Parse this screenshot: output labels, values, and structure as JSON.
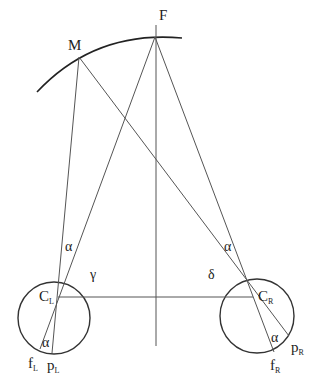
{
  "diagram": {
    "colors": {
      "stroke": "#333333",
      "arc": "#222222",
      "text": "#222222",
      "background": "#ffffff"
    },
    "points": {
      "F": {
        "label": "F",
        "x": 155,
        "y": 37
      },
      "M": {
        "label": "M",
        "x": 79,
        "y": 57
      },
      "CL": {
        "label": "C",
        "sub": "L",
        "x": 58,
        "y": 298
      },
      "CR": {
        "label": "C",
        "sub": "R",
        "x": 253,
        "y": 296
      },
      "fL": {
        "label": "f",
        "sub": "L",
        "x": 40,
        "y": 349
      },
      "pL": {
        "label": "p",
        "sub": "L",
        "x": 52,
        "y": 353
      },
      "fR": {
        "label": "f",
        "sub": "R",
        "x": 274,
        "y": 352
      },
      "pR": {
        "label": "p",
        "sub": "R",
        "x": 289,
        "y": 336
      }
    },
    "circles": [
      {
        "name": "left-eye",
        "cx": 54,
        "cy": 318,
        "r": 36
      },
      {
        "name": "right-eye",
        "cx": 257,
        "cy": 316,
        "r": 37
      }
    ],
    "angles": {
      "alpha": "α",
      "gamma": "γ",
      "delta": "δ"
    }
  }
}
